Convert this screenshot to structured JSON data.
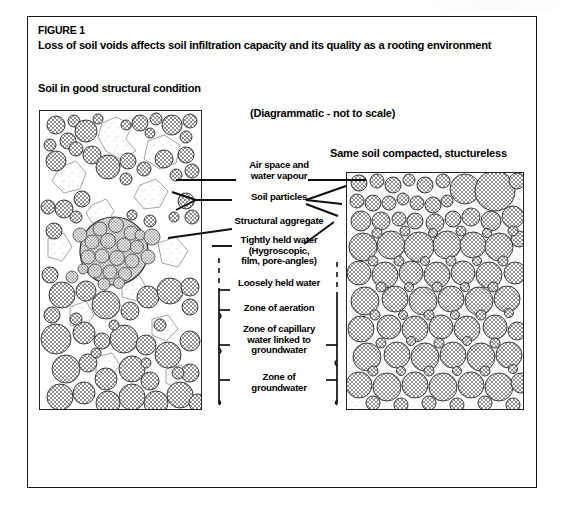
{
  "figure": {
    "number": "FIGURE 1",
    "title": "Loss of soil voids affects soil infiltration capacity and its quality as a rooting environment"
  },
  "headings": {
    "left_panel": "Soil in good structural condition",
    "scale_note": "(Diagrammatic - not to scale)",
    "right_panel": "Same soil compacted, stuctureless"
  },
  "labels": [
    {
      "id": "air-space",
      "text": "Air space and\nwater vapour"
    },
    {
      "id": "soil-particles",
      "text": "Soil particles"
    },
    {
      "id": "structural-aggregate",
      "text": "Structural aggregate"
    },
    {
      "id": "tightly-held-water",
      "text": "Tightly held water\n(Hygroscopic,\nfilm, pore-angles)"
    },
    {
      "id": "loosely-held-water",
      "text": "Loosely held water"
    },
    {
      "id": "zone-of-aeration",
      "text": "Zone of aeration"
    },
    {
      "id": "zone-of-capillary",
      "text": "Zone of capillary\nwater linked to\ngroundwater"
    },
    {
      "id": "zone-of-groundwater",
      "text": "Zone of\ngroundwater"
    }
  ],
  "colors": {
    "ink": "#1a1a1a",
    "particle_fill": "#9a9a9a",
    "particle_stroke": "#333333",
    "void_fill": "#ffffff",
    "frame": "#1a1a1a"
  },
  "diagram": {
    "type": "cross-section-schematic",
    "panels": [
      {
        "id": "good-structure",
        "description": "Soil in good structural condition: rounded soil particles of varied size with large irregular inter-aggregate voids (air space and water vapour), one large structural aggregate built from many small packed particles.",
        "void_fraction_visual": "high",
        "particle_count_visual": 95,
        "features": [
          "large voids",
          "structural aggregate",
          "varied particle size",
          "continuous pore network"
        ]
      },
      {
        "id": "compacted",
        "description": "Same soil compacted and structureless: particles densely packed with only small angular interstitial pores, no aggregates, no large continuous voids.",
        "void_fraction_visual": "low",
        "particle_count_visual": 120,
        "features": [
          "dense packing",
          "no aggregates",
          "small isolated pores"
        ]
      }
    ],
    "zones": [
      {
        "name": "Zone of aeration",
        "order": 1
      },
      {
        "name": "Zone of capillary water linked to groundwater",
        "order": 2
      },
      {
        "name": "Zone of groundwater",
        "order": 3
      }
    ]
  }
}
